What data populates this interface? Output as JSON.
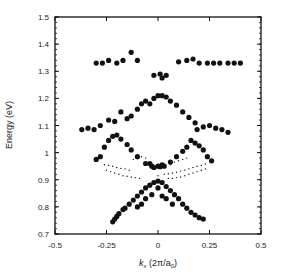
{
  "chart_data": {
    "type": "scatter",
    "title": "",
    "xlabel": "k_x (2π/a0)",
    "xlabel_parts": {
      "k": "k",
      "sub": "x",
      "rest": " (2π/a",
      "sub2": "0",
      "end": ")"
    },
    "ylabel": "Energy (eV)",
    "xlim": [
      -0.5,
      0.5
    ],
    "ylim": [
      0.7,
      1.5
    ],
    "grid": false,
    "x_ticks": [
      -0.5,
      -0.25,
      0,
      0.25,
      0.5
    ],
    "x_tick_labels": [
      "-0.5",
      "-0.25",
      "0",
      "0.25",
      "0.5"
    ],
    "y_ticks": [
      0.7,
      0.8,
      0.9,
      1.0,
      1.1,
      1.2,
      1.3,
      1.4,
      1.5
    ],
    "y_tick_labels": [
      "0.7",
      "0.8",
      "0.9",
      "1",
      "1.1",
      "1.2",
      "1.3",
      "1.4",
      "1.5"
    ],
    "series": [
      {
        "name": "large-dots",
        "marker": "filled-circle",
        "size": 2.6,
        "points": [
          [
            -0.3,
            1.33
          ],
          [
            -0.27,
            1.33
          ],
          [
            -0.24,
            1.34
          ],
          [
            -0.2,
            1.33
          ],
          [
            -0.17,
            1.34
          ],
          [
            -0.13,
            1.37
          ],
          [
            -0.1,
            1.34
          ],
          [
            -0.02,
            1.285
          ],
          [
            0.01,
            1.29
          ],
          [
            0.02,
            1.275
          ],
          [
            0.04,
            1.285
          ],
          [
            0.1,
            1.335
          ],
          [
            0.14,
            1.34
          ],
          [
            0.17,
            1.345
          ],
          [
            0.2,
            1.33
          ],
          [
            0.24,
            1.33
          ],
          [
            0.27,
            1.33
          ],
          [
            0.3,
            1.33
          ],
          [
            0.34,
            1.33
          ],
          [
            0.37,
            1.33
          ],
          [
            0.4,
            1.33
          ],
          [
            -0.37,
            1.085
          ],
          [
            -0.34,
            1.09
          ],
          [
            -0.31,
            1.085
          ],
          [
            -0.28,
            1.1
          ],
          [
            -0.24,
            1.12
          ],
          [
            -0.21,
            1.115
          ],
          [
            -0.18,
            1.15
          ],
          [
            -0.15,
            1.125
          ],
          [
            -0.13,
            1.135
          ],
          [
            -0.1,
            1.16
          ],
          [
            -0.08,
            1.18
          ],
          [
            -0.06,
            1.19
          ],
          [
            -0.04,
            1.18
          ],
          [
            -0.02,
            1.2
          ],
          [
            0.0,
            1.21
          ],
          [
            0.02,
            1.21
          ],
          [
            0.04,
            1.205
          ],
          [
            0.06,
            1.19
          ],
          [
            0.09,
            1.175
          ],
          [
            0.12,
            1.15
          ],
          [
            0.15,
            1.13
          ],
          [
            0.18,
            1.11
          ],
          [
            0.19,
            1.085
          ],
          [
            0.22,
            1.095
          ],
          [
            0.25,
            1.1
          ],
          [
            0.28,
            1.09
          ],
          [
            0.31,
            1.085
          ],
          [
            0.34,
            1.075
          ],
          [
            -0.3,
            0.975
          ],
          [
            -0.28,
            0.985
          ],
          [
            -0.26,
            1.02
          ],
          [
            -0.24,
            1.045
          ],
          [
            -0.22,
            1.06
          ],
          [
            -0.2,
            1.065
          ],
          [
            -0.18,
            1.05
          ],
          [
            -0.15,
            1.03
          ],
          [
            -0.13,
            1.01
          ],
          [
            -0.1,
            0.985
          ],
          [
            -0.06,
            0.96
          ],
          [
            -0.04,
            0.96
          ],
          [
            0.02,
            0.955
          ],
          [
            0.06,
            0.965
          ],
          [
            0.09,
            0.985
          ],
          [
            0.12,
            1.005
          ],
          [
            0.14,
            1.02
          ],
          [
            0.16,
            1.045
          ],
          [
            0.18,
            1.035
          ],
          [
            0.2,
            1.025
          ],
          [
            0.22,
            1.01
          ],
          [
            0.24,
            0.985
          ],
          [
            0.26,
            0.97
          ],
          [
            -0.03,
            0.95
          ],
          [
            -0.02,
            0.945
          ],
          [
            0.0,
            0.95
          ],
          [
            0.01,
            0.948
          ],
          [
            0.03,
            0.95
          ],
          [
            -0.22,
            0.745
          ],
          [
            -0.21,
            0.755
          ],
          [
            -0.2,
            0.765
          ],
          [
            -0.19,
            0.775
          ],
          [
            -0.17,
            0.79
          ],
          [
            -0.16,
            0.795
          ],
          [
            -0.14,
            0.81
          ],
          [
            -0.12,
            0.825
          ],
          [
            -0.1,
            0.84
          ],
          [
            -0.08,
            0.855
          ],
          [
            -0.06,
            0.87
          ],
          [
            -0.04,
            0.88
          ],
          [
            -0.02,
            0.89
          ],
          [
            0.0,
            0.895
          ],
          [
            0.02,
            0.89
          ],
          [
            0.04,
            0.875
          ],
          [
            0.06,
            0.86
          ],
          [
            0.08,
            0.845
          ],
          [
            0.1,
            0.83
          ],
          [
            0.12,
            0.81
          ],
          [
            0.14,
            0.795
          ],
          [
            0.16,
            0.78
          ],
          [
            0.18,
            0.77
          ],
          [
            0.2,
            0.76
          ],
          [
            0.22,
            0.755
          ],
          [
            -0.08,
            0.81
          ],
          [
            -0.06,
            0.83
          ],
          [
            -0.03,
            0.845
          ],
          [
            0.0,
            0.87
          ],
          [
            0.02,
            0.84
          ],
          [
            0.04,
            0.83
          ],
          [
            0.07,
            0.81
          ],
          [
            -0.1,
            0.8
          ]
        ]
      },
      {
        "name": "small-dots",
        "marker": "small-point",
        "size": 0.7,
        "points": [
          [
            -0.26,
            0.955
          ],
          [
            -0.24,
            0.953
          ],
          [
            -0.22,
            0.95
          ],
          [
            -0.2,
            0.945
          ],
          [
            -0.18,
            0.942
          ],
          [
            -0.16,
            0.94
          ],
          [
            -0.14,
            0.935
          ],
          [
            -0.25,
            0.935
          ],
          [
            -0.23,
            0.93
          ],
          [
            -0.21,
            0.925
          ],
          [
            -0.19,
            0.92
          ],
          [
            -0.17,
            0.915
          ],
          [
            -0.15,
            0.913
          ],
          [
            -0.13,
            0.91
          ],
          [
            -0.11,
            0.908
          ],
          [
            -0.09,
            0.905
          ],
          [
            -0.12,
            0.975
          ],
          [
            -0.1,
            0.98
          ],
          [
            -0.08,
            0.985
          ],
          [
            -0.06,
            0.98
          ],
          [
            0.06,
            0.955
          ],
          [
            0.08,
            0.965
          ],
          [
            0.1,
            0.97
          ],
          [
            0.12,
            0.975
          ],
          [
            0.14,
            0.98
          ],
          [
            0.0,
            0.915
          ],
          [
            0.03,
            0.92
          ],
          [
            0.05,
            0.922
          ],
          [
            0.07,
            0.925
          ],
          [
            0.09,
            0.928
          ],
          [
            0.11,
            0.932
          ],
          [
            0.13,
            0.935
          ],
          [
            0.15,
            0.94
          ],
          [
            0.17,
            0.945
          ],
          [
            0.19,
            0.95
          ],
          [
            0.21,
            0.953
          ],
          [
            0.23,
            0.958
          ],
          [
            0.05,
            0.905
          ],
          [
            0.07,
            0.905
          ],
          [
            0.09,
            0.908
          ],
          [
            0.11,
            0.91
          ],
          [
            0.13,
            0.915
          ],
          [
            0.15,
            0.92
          ],
          [
            0.17,
            0.925
          ],
          [
            0.19,
            0.93
          ],
          [
            0.21,
            0.935
          ],
          [
            0.23,
            0.94
          ]
        ]
      }
    ]
  },
  "colors": {
    "ink": "#111111",
    "background": "#ffffff"
  }
}
